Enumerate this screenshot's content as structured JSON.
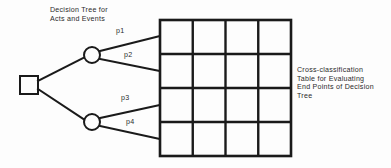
{
  "figure": {
    "width": 391,
    "height": 168,
    "background_color": "#fdfdfd",
    "stroke_color": "#1a1a1a",
    "text_color": "#2b2b2b"
  },
  "captions": {
    "tree": "Decision Tree for\nActs and Events",
    "table": "Cross-classification\nTable for Evaluating\nEnd Points of Decision\nTree"
  },
  "decision_tree": {
    "root_node": {
      "shape": "square",
      "label": "",
      "x": 29,
      "y": 85,
      "size": 18
    },
    "chance_nodes": [
      {
        "shape": "circle",
        "label": "",
        "x": 92,
        "y": 55,
        "radius": 8
      },
      {
        "shape": "circle",
        "label": "",
        "x": 92,
        "y": 122,
        "radius": 8
      }
    ],
    "branch_labels": [
      "p1",
      "p2",
      "p3",
      "p4"
    ],
    "branches": [
      {
        "label": "p1",
        "from_x": 100,
        "from_y": 51,
        "to_x": 160,
        "to_y": 36,
        "label_x": 116,
        "label_y": 32
      },
      {
        "label": "p2",
        "from_x": 100,
        "from_y": 59,
        "to_x": 160,
        "to_y": 71,
        "label_x": 124,
        "label_y": 56
      },
      {
        "label": "p3",
        "from_x": 100,
        "from_y": 118,
        "to_x": 160,
        "to_y": 105,
        "label_x": 121,
        "label_y": 99
      },
      {
        "label": "p4",
        "from_x": 100,
        "from_y": 126,
        "to_x": 160,
        "to_y": 139,
        "label_x": 126,
        "label_y": 123
      }
    ],
    "root_edges": [
      {
        "from_x": 38,
        "from_y": 81,
        "to_x": 85,
        "to_y": 57
      },
      {
        "from_x": 38,
        "from_y": 89,
        "to_x": 85,
        "to_y": 120
      }
    ]
  },
  "cross_classification_table": {
    "rows": 4,
    "columns": 4,
    "left": 160,
    "top": 20,
    "right": 291,
    "bottom": 156,
    "cells": [
      [
        "",
        "",
        "",
        ""
      ],
      [
        "",
        "",
        "",
        ""
      ],
      [
        "",
        "",
        "",
        ""
      ],
      [
        "",
        "",
        "",
        ""
      ]
    ],
    "row_labels": [
      "",
      "",
      "",
      ""
    ],
    "column_labels": [
      "",
      "",
      "",
      ""
    ]
  }
}
